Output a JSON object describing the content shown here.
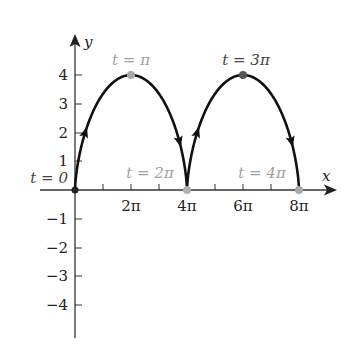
{
  "figure": {
    "axes": {
      "x_label": "x",
      "y_label": "y",
      "x_ticks": [
        {
          "value_pi": 2,
          "label": "2π"
        },
        {
          "value_pi": 4,
          "label": "4π"
        },
        {
          "value_pi": 6,
          "label": "6π"
        },
        {
          "value_pi": 8,
          "label": "8π"
        }
      ],
      "y_ticks": [
        {
          "value": 4,
          "label": "4"
        },
        {
          "value": 3,
          "label": "3"
        },
        {
          "value": 2,
          "label": "2"
        },
        {
          "value": 1,
          "label": "1"
        },
        {
          "value": -1,
          "label": "−1"
        },
        {
          "value": -2,
          "label": "−2"
        },
        {
          "value": -3,
          "label": "−3"
        },
        {
          "value": -4,
          "label": "−4"
        }
      ]
    },
    "annotations": [
      {
        "text": "t = 0",
        "at": "origin"
      },
      {
        "text": "t = π",
        "at": "peak-1"
      },
      {
        "text": "t = 2π",
        "at": "cusp-1"
      },
      {
        "text": "t = 3π",
        "at": "peak-2"
      },
      {
        "text": "t = 4π",
        "at": "cusp-2"
      }
    ],
    "curve": {
      "description": "Cycloid x = 2(t − sin t), y = 2(1 − cos t), 0 ≤ t ≤ 4π",
      "t_range": [
        0,
        "4π"
      ],
      "key_points": [
        {
          "t": "0",
          "x": "0",
          "y": 0
        },
        {
          "t": "π",
          "x": "2π",
          "y": 4
        },
        {
          "t": "2π",
          "x": "4π",
          "y": 0
        },
        {
          "t": "3π",
          "x": "6π",
          "y": 4
        },
        {
          "t": "4π",
          "x": "8π",
          "y": 0
        }
      ]
    },
    "colors": {
      "curve": "#111111",
      "axis": "#333333",
      "label_light": "#a0a0a0",
      "label_dark": "#444444",
      "point_light": "#a8a8a8",
      "point_dark": "#555555"
    }
  }
}
